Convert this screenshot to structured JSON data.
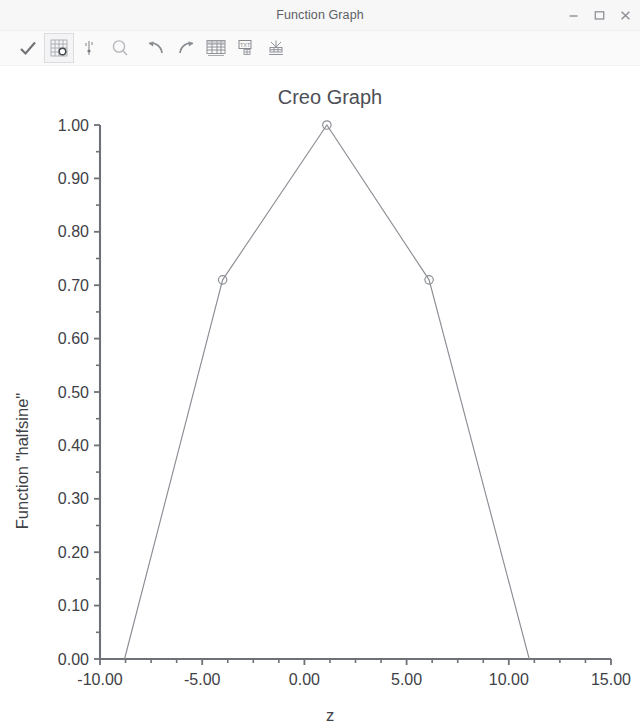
{
  "window": {
    "title": "Function Graph",
    "controls": [
      {
        "name": "minimize-button",
        "label": "Minimize",
        "glyph": "minimize"
      },
      {
        "name": "maximize-button",
        "label": "Maximize",
        "glyph": "maximize"
      },
      {
        "name": "close-button",
        "label": "Close",
        "glyph": "close"
      }
    ]
  },
  "toolbar": {
    "items": [
      {
        "name": "accept-checkmark-button",
        "icon": "check-icon",
        "label": "OK / Accept",
        "framed": false
      },
      {
        "name": "graph-properties-button",
        "icon": "grid-properties-icon",
        "label": "Graph Properties",
        "framed": true
      },
      {
        "name": "axis-scale-button",
        "icon": "axis-scale-icon",
        "label": "Axis Scale",
        "framed": false
      },
      {
        "name": "zoom-button",
        "icon": "magnifier-icon",
        "label": "Zoom",
        "framed": false
      },
      {
        "name": "undo-button",
        "icon": "undo-arrow-icon",
        "label": "Undo",
        "framed": false
      },
      {
        "name": "redo-button",
        "icon": "redo-arrow-icon",
        "label": "Redo",
        "framed": false
      },
      {
        "name": "show-table-button",
        "icon": "table-icon",
        "label": "Show Table",
        "framed": false
      },
      {
        "name": "text-table-button",
        "icon": "text-table-icon",
        "label": "Text Table",
        "framed": false
      },
      {
        "name": "export-graph-button",
        "icon": "export-graph-icon",
        "label": "Export Graph",
        "framed": false
      }
    ]
  },
  "colors": {
    "title_text": "#4c4f55",
    "axis": "#6e7177",
    "series": "#8b8e94",
    "background": "#ffffff",
    "chrome": "#f7f7f8"
  },
  "chart_data": {
    "type": "line",
    "title": "Creo Graph",
    "xlabel": "z",
    "ylabel": "Function \"halfsine\"",
    "grid": false,
    "legend": false,
    "xlim": [
      -10.0,
      15.0
    ],
    "ylim": [
      0.0,
      1.0
    ],
    "xticks": [
      -10.0,
      -5.0,
      0.0,
      5.0,
      10.0,
      15.0
    ],
    "xtick_labels": [
      "-10.00",
      "-5.00",
      "0.00",
      "5.00",
      "10.00",
      "15.00"
    ],
    "xtick_minor_step": 1.25,
    "yticks": [
      0.0,
      0.1,
      0.2,
      0.3,
      0.4,
      0.5,
      0.6,
      0.7,
      0.8,
      0.9,
      1.0
    ],
    "ytick_labels": [
      "0.00",
      "0.10",
      "0.20",
      "0.30",
      "0.40",
      "0.50",
      "0.60",
      "0.70",
      "0.80",
      "0.90",
      "1.00"
    ],
    "ytick_minor_step": 0.05,
    "series": [
      {
        "name": "halfsine",
        "marker": "open-circle",
        "x": [
          -8.8,
          -4.0,
          1.1,
          6.1,
          11.0
        ],
        "y": [
          0.0,
          0.71,
          1.0,
          0.71,
          0.0
        ],
        "marker_points": [
          {
            "x": -4.0,
            "y": 0.71
          },
          {
            "x": 1.1,
            "y": 1.0
          },
          {
            "x": 6.1,
            "y": 0.71
          }
        ]
      }
    ]
  }
}
